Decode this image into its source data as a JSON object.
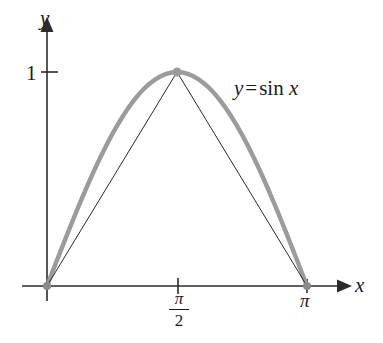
{
  "figure": {
    "kind": "cartesian-plot",
    "background_color": "#ffffff",
    "axes": {
      "x_axis_label": "x",
      "y_axis_label": "y",
      "axis_color": "#2b2b2b",
      "x_ticks": [
        {
          "label_numerator": "π",
          "label_denominator": "2",
          "is_fraction": true,
          "value": 1.5707963
        },
        {
          "label_numerator": "π",
          "label_denominator": "",
          "is_fraction": false,
          "value": 3.1415927
        }
      ],
      "y_ticks": [
        {
          "label": "1",
          "value": 1
        }
      ]
    },
    "annotations": [
      {
        "name": "curve-equation",
        "lhs": "y",
        "operator": "=",
        "function": "sin",
        "argument": "x"
      }
    ]
  },
  "chart_data": {
    "type": "line",
    "title": "",
    "subtitle": "",
    "xlabel": "x",
    "ylabel": "y",
    "xlim": [
      0,
      3.1415927
    ],
    "ylim": [
      0,
      1
    ],
    "grid": false,
    "legend": "none",
    "series": [
      {
        "name": "y = sin x",
        "style": "thick-gray-smooth-curve",
        "color": "#9b9b9b",
        "linewidth": 4.4,
        "x": [
          0,
          0.1308997,
          0.2617994,
          0.3926991,
          0.5235988,
          0.6544985,
          0.7853982,
          0.9162979,
          1.0471976,
          1.1780972,
          1.3089969,
          1.4398966,
          1.5707963,
          1.701696,
          1.8325957,
          1.9634954,
          2.0943951,
          2.2252948,
          2.3561945,
          2.4870942,
          2.6179939,
          2.7488936,
          2.8797933,
          3.010693,
          3.1415927
        ],
        "y": [
          0.0,
          0.1305,
          0.2588,
          0.3827,
          0.5,
          0.6088,
          0.7071,
          0.7934,
          0.866,
          0.9239,
          0.9659,
          0.9914,
          1.0,
          0.9914,
          0.9659,
          0.9239,
          0.866,
          0.7934,
          0.7071,
          0.6088,
          0.5,
          0.3827,
          0.2588,
          0.1305,
          0.0
        ]
      },
      {
        "name": "inscribed-triangle",
        "style": "thin-dark-polyline",
        "color": "#2b2b2b",
        "linewidth": 1,
        "x": [
          0,
          1.5707963,
          3.1415927
        ],
        "y": [
          0,
          1,
          0
        ]
      }
    ],
    "markers": [
      {
        "name": "origin-point",
        "x": 0,
        "y": 0,
        "color": "#8a8a8a",
        "radius": 4
      },
      {
        "name": "peak-point",
        "x": 1.5707963,
        "y": 1,
        "color": "#9b9b9b",
        "radius": 4.5
      },
      {
        "name": "pi-point",
        "x": 3.1415927,
        "y": 0,
        "color": "#8a8a8a",
        "radius": 4
      }
    ],
    "annotations": [
      {
        "text": "y = sin x",
        "x": 2.15,
        "y": 0.92
      }
    ]
  }
}
